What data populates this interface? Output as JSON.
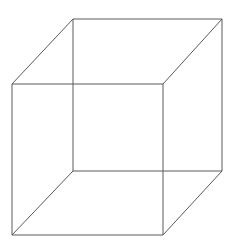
{
  "figure": {
    "name": "necker-cube",
    "type": "line-drawing",
    "canvas": {
      "width": 239,
      "height": 245,
      "background_color": "#ffffff"
    },
    "style": {
      "stroke_color": "#5a5a5a",
      "stroke_width": 1,
      "fill": "none"
    },
    "vertices": {
      "back_top_left": {
        "x": 73,
        "y": 19
      },
      "back_top_right": {
        "x": 222,
        "y": 19
      },
      "back_bottom_right": {
        "x": 222,
        "y": 171
      },
      "back_bottom_left": {
        "x": 73,
        "y": 171
      },
      "front_top_left": {
        "x": 12,
        "y": 84
      },
      "front_top_right": {
        "x": 163,
        "y": 84
      },
      "front_bottom_right": {
        "x": 163,
        "y": 235
      },
      "front_bottom_left": {
        "x": 12,
        "y": 235
      }
    },
    "edges": [
      {
        "name": "back-top-edge",
        "from": "back_top_left",
        "to": "back_top_right",
        "x1": 73,
        "y1": 19,
        "x2": 222,
        "y2": 19
      },
      {
        "name": "back-right-edge",
        "from": "back_top_right",
        "to": "back_bottom_right",
        "x1": 222,
        "y1": 19,
        "x2": 222,
        "y2": 171
      },
      {
        "name": "back-bottom-edge",
        "from": "back_bottom_right",
        "to": "back_bottom_left",
        "x1": 222,
        "y1": 171,
        "x2": 73,
        "y2": 171
      },
      {
        "name": "back-left-edge",
        "from": "back_bottom_left",
        "to": "back_top_left",
        "x1": 73,
        "y1": 171,
        "x2": 73,
        "y2": 19
      },
      {
        "name": "front-top-edge",
        "from": "front_top_left",
        "to": "front_top_right",
        "x1": 12,
        "y1": 84,
        "x2": 163,
        "y2": 84
      },
      {
        "name": "front-right-edge",
        "from": "front_top_right",
        "to": "front_bottom_right",
        "x1": 163,
        "y1": 84,
        "x2": 163,
        "y2": 235
      },
      {
        "name": "front-bottom-edge",
        "from": "front_bottom_right",
        "to": "front_bottom_left",
        "x1": 163,
        "y1": 235,
        "x2": 12,
        "y2": 235
      },
      {
        "name": "front-left-edge",
        "from": "front_bottom_left",
        "to": "front_top_left",
        "x1": 12,
        "y1": 235,
        "x2": 12,
        "y2": 84
      },
      {
        "name": "connector-top-left",
        "from": "back_top_left",
        "to": "front_top_left",
        "x1": 73,
        "y1": 19,
        "x2": 12,
        "y2": 84
      },
      {
        "name": "connector-top-right",
        "from": "back_top_right",
        "to": "front_top_right",
        "x1": 222,
        "y1": 19,
        "x2": 163,
        "y2": 84
      },
      {
        "name": "connector-bottom-right",
        "from": "back_bottom_right",
        "to": "front_bottom_right",
        "x1": 222,
        "y1": 171,
        "x2": 163,
        "y2": 235
      },
      {
        "name": "connector-bottom-left",
        "from": "back_bottom_left",
        "to": "front_bottom_left",
        "x1": 73,
        "y1": 171,
        "x2": 12,
        "y2": 235
      }
    ]
  }
}
